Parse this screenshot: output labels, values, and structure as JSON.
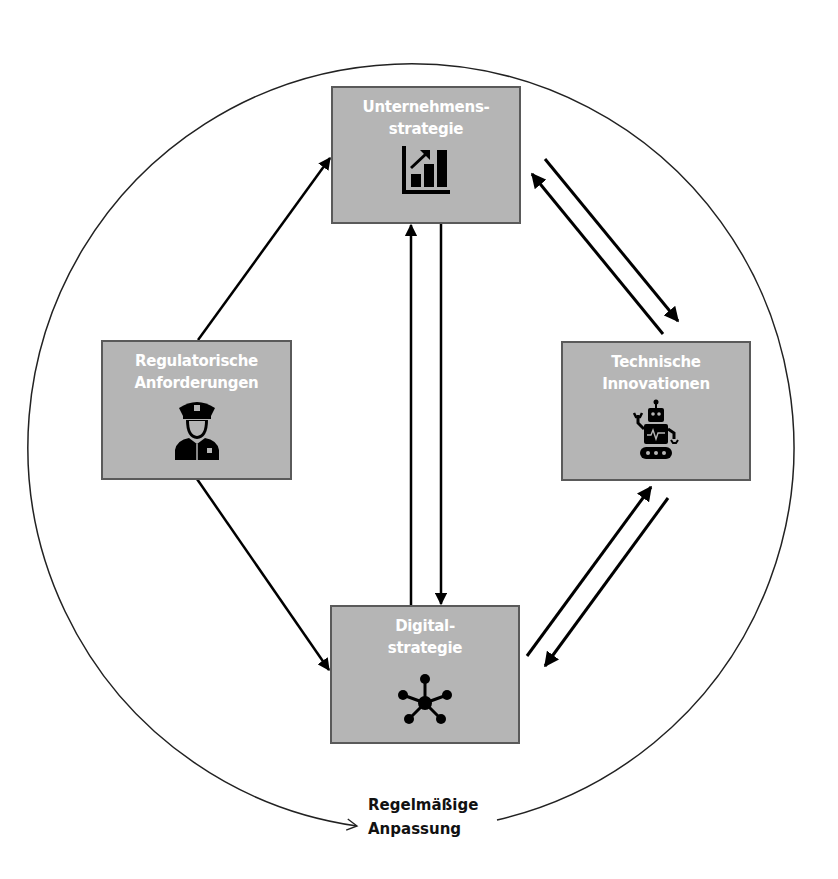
{
  "diagram": {
    "colors": {
      "box_fill": "#b5b5b5",
      "box_border": "#5a5a5a",
      "box_text": "#ffffff",
      "arrow": "#000000",
      "circle": "#222222"
    },
    "nodes": [
      {
        "id": "unternehmensstrategie",
        "label": "Unternehmens-\nstrategie",
        "icon": "bar-chart-growth-icon"
      },
      {
        "id": "regulatorische",
        "label": "Regulatorische\nAnforderungen",
        "icon": "police-officer-icon"
      },
      {
        "id": "technische",
        "label": "Technische\nInnovationen",
        "icon": "robot-icon"
      },
      {
        "id": "digitalstrategie",
        "label": "Digital-\nstrategie",
        "icon": "network-hub-icon"
      }
    ],
    "edges": [
      {
        "from": "regulatorische",
        "to": "unternehmensstrategie"
      },
      {
        "from": "regulatorische",
        "to": "digitalstrategie"
      },
      {
        "from": "digitalstrategie",
        "to": "unternehmensstrategie"
      },
      {
        "from": "unternehmensstrategie",
        "to": "digitalstrategie"
      },
      {
        "from": "unternehmensstrategie",
        "to": "technische"
      },
      {
        "from": "technische",
        "to": "unternehmensstrategie"
      },
      {
        "from": "digitalstrategie",
        "to": "technische"
      },
      {
        "from": "technische",
        "to": "digitalstrategie"
      }
    ],
    "cycle": {
      "label": "Regelmäßige\nAnpassung",
      "shape": "circle-arrow"
    }
  }
}
